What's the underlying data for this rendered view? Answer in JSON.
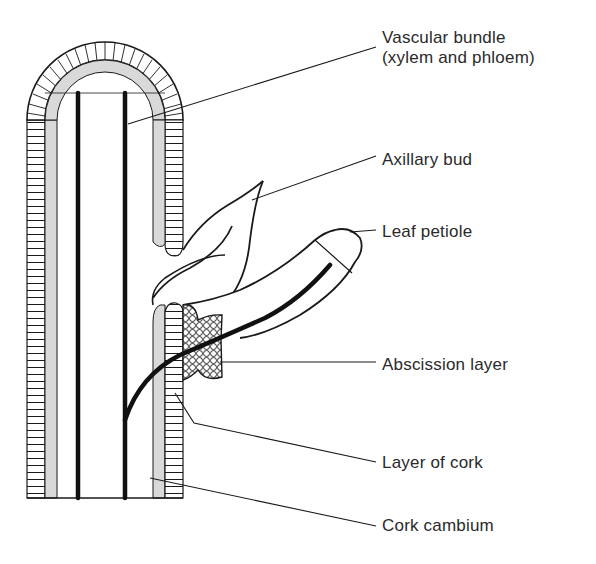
{
  "figure": {
    "colors": {
      "ink": "#1a1a1a",
      "cambium_fill": "#d9d9d9",
      "background": "#ffffff",
      "label_text": "#2a2a2a"
    }
  },
  "labels": [
    {
      "id": "vascular-bundle",
      "lines": [
        "Vascular bundle",
        "(xylem and phloem)"
      ]
    },
    {
      "id": "axillary-bud",
      "lines": [
        "Axillary bud"
      ]
    },
    {
      "id": "leaf-petiole",
      "lines": [
        "Leaf petiole"
      ]
    },
    {
      "id": "abscission-layer",
      "lines": [
        "Abscission layer"
      ]
    },
    {
      "id": "layer-of-cork",
      "lines": [
        "Layer of cork"
      ]
    },
    {
      "id": "cork-cambium",
      "lines": [
        "Cork cambium"
      ]
    }
  ]
}
